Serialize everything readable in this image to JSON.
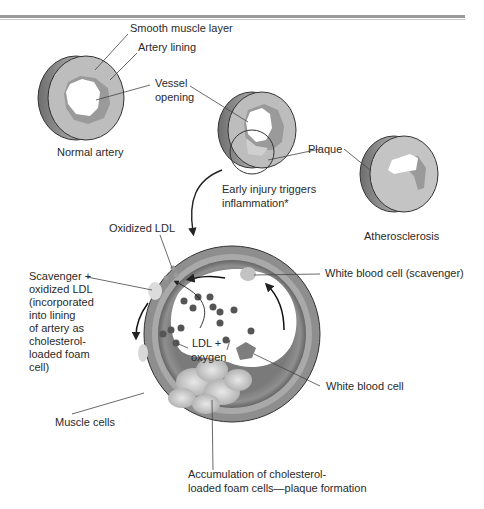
{
  "header": {
    "rule": "double-horizontal-rule"
  },
  "labels": {
    "smooth_muscle_layer": "Smooth muscle layer",
    "artery_lining": "Artery lining",
    "vessel_opening_1": "Vessel",
    "vessel_opening_2": "opening",
    "normal_artery": "Normal artery",
    "plaque": "Plaque",
    "early_injury_1": "Early injury triggers",
    "early_injury_2": "inflammation*",
    "atherosclerosis": "Atherosclerosis",
    "oxidized_ldl": "Oxidized LDL",
    "scavenger_1": "Scavenger +",
    "scavenger_2": "oxidized LDL",
    "scavenger_3": "(incorporated",
    "scavenger_4": "into lining",
    "scavenger_5": "of artery as",
    "scavenger_6": "cholesterol-",
    "scavenger_7": "loaded foam",
    "scavenger_8": "cell)",
    "wbc_scavenger": "White blood cell (scavenger)",
    "ldl_oxygen_1": "LDL +",
    "ldl_oxygen_2": "oxygen",
    "white_blood_cell": "White blood cell",
    "muscle_cells": "Muscle cells",
    "accumulation_1": "Accumulation of cholesterol-",
    "accumulation_2": "loaded foam cells—plaque formation"
  },
  "colors": {
    "outer_wall": "#8c8c8c",
    "muscle_layer": "#b9b9b9",
    "lining": "#9d9d9d",
    "plaque": "#c6c6c6",
    "lumen": "#ffffff",
    "ldl_dot": "#555555",
    "deep_wall": "#6f6f6f"
  }
}
